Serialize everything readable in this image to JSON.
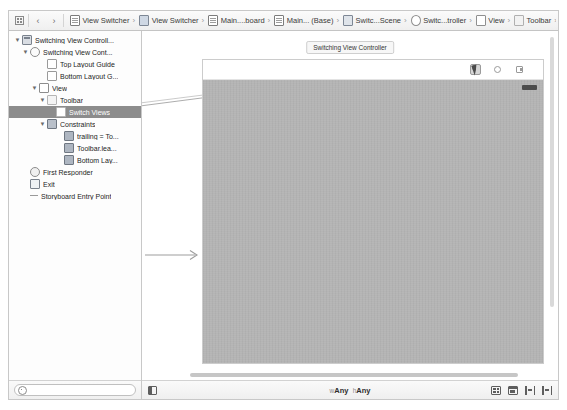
{
  "jumpbar": {
    "grid_icon": "grid-icon",
    "back_label": "‹",
    "forward_label": "›",
    "crumbs": [
      {
        "label": "View Switcher",
        "icon": "project-icon",
        "sep": "›"
      },
      {
        "label": "View Switcher",
        "icon": "folder-icon",
        "sep": "›"
      },
      {
        "label": "Main....board",
        "icon": "document-icon",
        "sep": "›"
      },
      {
        "label": "Main... (Base)",
        "icon": "document-icon",
        "sep": "›"
      },
      {
        "label": "Switc...Scene",
        "icon": "scene-icon",
        "sep": "›"
      },
      {
        "label": "Switc...troller",
        "icon": "view-controller-icon",
        "sep": "›"
      },
      {
        "label": "View",
        "icon": "view-icon",
        "sep": "›"
      },
      {
        "label": "Toolbar",
        "icon": "toolbar-icon",
        "sep": "›"
      },
      {
        "label": "Switch Views",
        "icon": "bar-button-icon",
        "sep": ""
      }
    ]
  },
  "outline": {
    "rows": [
      {
        "label": "Switching View Controll...",
        "indent": 0,
        "twist": "▼",
        "icon": "view-controller-scene-icon",
        "selected": false
      },
      {
        "label": "Switching View Cont...",
        "indent": 1,
        "twist": "▼",
        "icon": "view-controller-icon",
        "selected": false
      },
      {
        "label": "Top Layout Guide",
        "indent": 2,
        "twist": "",
        "icon": "layout-guide-icon",
        "selected": false
      },
      {
        "label": "Bottom Layout G...",
        "indent": 2,
        "twist": "",
        "icon": "layout-guide-icon",
        "selected": false
      },
      {
        "label": "View",
        "indent": 2,
        "twist": "▼",
        "icon": "view-icon",
        "selected": false
      },
      {
        "label": "Toolbar",
        "indent": 3,
        "twist": "▼",
        "icon": "toolbar-icon",
        "selected": false
      },
      {
        "label": "Switch Views",
        "indent": 4,
        "twist": "",
        "icon": "bar-button-item-icon",
        "selected": true
      },
      {
        "label": "Constraints",
        "indent": 3,
        "twist": "▼",
        "icon": "constraints-icon",
        "selected": false
      },
      {
        "label": "trailing = To...",
        "indent": 4,
        "twist": "",
        "icon": "constraint-icon",
        "selected": false
      },
      {
        "label": "Toolbar.lea...",
        "indent": 4,
        "twist": "",
        "icon": "constraint-icon",
        "selected": false
      },
      {
        "label": "Bottom Lay...",
        "indent": 4,
        "twist": "",
        "icon": "constraint-icon",
        "selected": false
      },
      {
        "label": "First Responder",
        "indent": 1,
        "twist": "",
        "icon": "first-responder-icon",
        "selected": false
      },
      {
        "label": "Exit",
        "indent": 1,
        "twist": "",
        "icon": "exit-icon",
        "selected": false
      },
      {
        "label": "Storyboard Entry Point",
        "indent": 1,
        "twist": "",
        "icon": "entry-point-icon",
        "selected": false
      }
    ],
    "filter_placeholder": ""
  },
  "canvas": {
    "scene_title": "Switching View Controller",
    "toolbar_items": [
      {
        "name": "switch-views-button",
        "glyph": "cursor-icon",
        "selected": true
      },
      {
        "name": "second-bar-button",
        "glyph": "gear-icon",
        "selected": false
      },
      {
        "name": "third-bar-button",
        "glyph": "page-icon",
        "selected": false
      }
    ]
  },
  "bottom_bar": {
    "document_outline_label": "document-outline-toggle",
    "size_class": {
      "width_label": "w",
      "width_value": "Any",
      "height_label": "h",
      "height_value": "Any"
    },
    "tools": [
      {
        "name": "align-button",
        "icon": "align-icon"
      },
      {
        "name": "pin-button",
        "icon": "pin-icon"
      },
      {
        "name": "resolve-button",
        "icon": "resolve-auto-layout-icon",
        "text": "|○|"
      },
      {
        "name": "resize-button",
        "icon": "resizing-behavior-icon",
        "text": "|Δ|"
      }
    ]
  },
  "colors": {
    "selection": "#8c8c8c",
    "canvas_view": "#b4b4b4",
    "chrome": "#efefef"
  }
}
